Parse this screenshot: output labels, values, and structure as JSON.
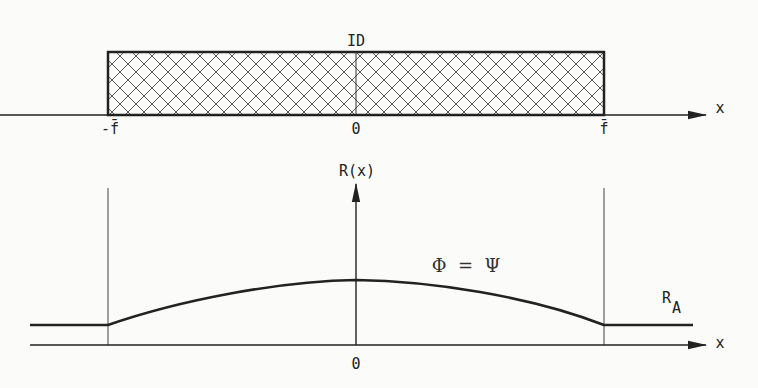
{
  "diagram": {
    "top_panel": {
      "region_label": "ID",
      "axis_label": "x",
      "ticks": [
        {
          "label": "-f̄",
          "x": 110
        },
        {
          "label": "0",
          "x": 356
        },
        {
          "label": "f̄",
          "x": 604
        }
      ],
      "region": {
        "from": "-f̄",
        "to": "f̄",
        "fill": "cross-hatch"
      }
    },
    "bottom_panel": {
      "y_axis_label": "R(x)",
      "x_axis_label": "x",
      "origin_label": "0",
      "equation": "Φ  =  Ψ",
      "asymptote_label": "R",
      "asymptote_subscript": "A",
      "curve": {
        "description": "R(x) constant R_A outside [-f̄, f̄], rising to a smooth maximum at x=0 inside",
        "points": [
          [
            30,
            325
          ],
          [
            108,
            325
          ],
          [
            180,
            306
          ],
          [
            260,
            290
          ],
          [
            320,
            282
          ],
          [
            356,
            280
          ],
          [
            400,
            283
          ],
          [
            460,
            291
          ],
          [
            530,
            303
          ],
          [
            604,
            325
          ],
          [
            693,
            325
          ]
        ]
      }
    },
    "colors": {
      "ink": "#222222",
      "background": "#fbfbf9"
    }
  }
}
